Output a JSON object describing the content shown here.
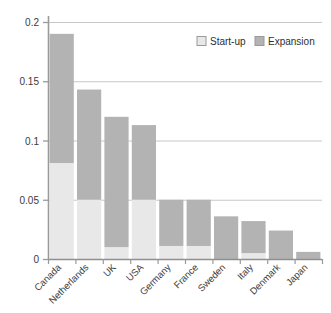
{
  "chart_data": {
    "type": "bar",
    "title": "",
    "subtitle": "",
    "xlabel": "",
    "ylabel": "",
    "stacked": true,
    "grid": true,
    "legend_position": "top-right",
    "ylim": [
      0,
      0.2
    ],
    "yticks": [
      0,
      0.05,
      0.1,
      0.15,
      0.2
    ],
    "ytick_labels": [
      "0",
      "0.05",
      "0.1",
      "0.15",
      "0.2"
    ],
    "categories": [
      "Canada",
      "Netherlands",
      "UK",
      "USA",
      "Germany",
      "France",
      "Sweden",
      "Italy",
      "Denmark",
      "Japan"
    ],
    "series": [
      {
        "name": "Start-up",
        "color": "#e8e8e8",
        "values": [
          0.081,
          0.05,
          0.01,
          0.05,
          0.011,
          0.011,
          0.0,
          0.005,
          0.0,
          0.0
        ]
      },
      {
        "name": "Expansion",
        "color": "#b3b3b3",
        "values": [
          0.109,
          0.093,
          0.11,
          0.063,
          0.039,
          0.039,
          0.036,
          0.027,
          0.024,
          0.006
        ]
      }
    ],
    "totals": [
      0.19,
      0.143,
      0.12,
      0.113,
      0.05,
      0.05,
      0.036,
      0.032,
      0.024,
      0.006
    ]
  },
  "legend": {
    "items": [
      {
        "label": "Start-up",
        "swatch_color": "#e8e8e8"
      },
      {
        "label": "Expansion",
        "swatch_color": "#b3b3b3"
      }
    ]
  },
  "axis": {
    "y_tick_labels": [
      "0.2",
      "0.15",
      "0.1",
      "0.05",
      "0"
    ],
    "x_tick_labels": [
      "Canada",
      "Netherlands",
      "UK",
      "USA",
      "Germany",
      "France",
      "Sweden",
      "Italy",
      "Denmark",
      "Japan"
    ]
  },
  "colors": {
    "startup": "#e8e8e8",
    "expansion": "#b3b3b3",
    "grid": "#c8c8c8",
    "axis": "#9a9a9a",
    "text": "#3b3b3b"
  }
}
